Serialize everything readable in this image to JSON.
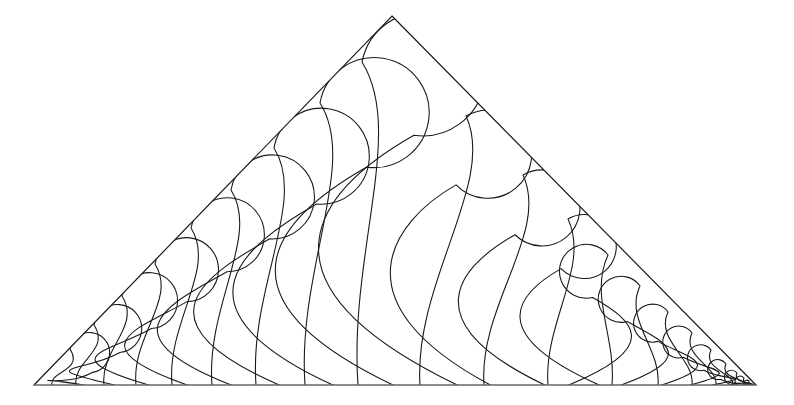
{
  "figure": {
    "title": "Nested teardrop tiling inside an isosceles triangle",
    "background_color": "#ffffff",
    "stroke_color": "#1a1a1a",
    "baseline_color": "#8c8c8c",
    "stroke_width": 1.1,
    "canvas": {
      "width": 794,
      "height": 405
    }
  },
  "triangle": {
    "name": "outer-triangle",
    "apex": {
      "x": 392,
      "y": 16
    },
    "bottom_left": {
      "x": 34,
      "y": 385
    },
    "bottom_right": {
      "x": 756,
      "y": 385
    },
    "base_width": 722,
    "height": 369,
    "left_slope_label": "left-slope",
    "right_slope_label": "right-slope",
    "base_label": "baseline"
  },
  "chart_data": {
    "type": "diagram",
    "title": "Nested teardrop tiling inside an isosceles triangle",
    "left_fan_count": 12,
    "right_fan_count": 9,
    "total_teardrops": 21,
    "left_fan": [
      {
        "index": 1,
        "base_x": 52,
        "bulb_cx": 89,
        "bulb_cy": 352,
        "bulb_r": 20,
        "tangent_x": 70,
        "tangent_y": 349
      },
      {
        "index": 2,
        "base_x": 76,
        "bulb_cx": 116,
        "bulb_cy": 328,
        "bulb_r": 24,
        "tangent_x": 94,
        "tangent_y": 325
      },
      {
        "index": 3,
        "base_x": 104,
        "bulb_cx": 147,
        "bulb_cy": 300,
        "bulb_r": 28,
        "tangent_x": 122,
        "tangent_y": 296
      },
      {
        "index": 4,
        "base_x": 136,
        "bulb_cx": 182,
        "bulb_cy": 269,
        "bulb_r": 32,
        "tangent_x": 155,
        "tangent_y": 264
      },
      {
        "index": 5,
        "base_x": 172,
        "bulb_cx": 221,
        "bulb_cy": 234,
        "bulb_r": 37,
        "tangent_x": 191,
        "tangent_y": 228
      },
      {
        "index": 6,
        "base_x": 212,
        "bulb_cx": 263,
        "bulb_cy": 196,
        "bulb_r": 42,
        "tangent_x": 231,
        "tangent_y": 190
      },
      {
        "index": 7,
        "base_x": 256,
        "bulb_cx": 309,
        "bulb_cy": 155,
        "bulb_r": 48,
        "tangent_x": 274,
        "tangent_y": 148
      },
      {
        "index": 8,
        "base_x": 305,
        "bulb_cx": 358,
        "bulb_cy": 111,
        "bulb_r": 55,
        "tangent_x": 320,
        "tangent_y": 103
      },
      {
        "index": 9,
        "base_x": 358,
        "bulb_cx": 404,
        "bulb_cy": 72,
        "bulb_r": 62,
        "tangent_x": 362,
        "tangent_y": 62
      },
      {
        "index": 10,
        "base_x": 420,
        "bulb_cx": 449,
        "bulb_cy": 140,
        "bulb_r": 44,
        "tangent_x": 466,
        "tangent_y": 116
      },
      {
        "index": 11,
        "base_x": 484,
        "bulb_cx": 509,
        "bulb_cy": 196,
        "bulb_r": 38,
        "tangent_x": 523,
        "tangent_y": 175
      },
      {
        "index": 12,
        "base_x": 548,
        "bulb_cx": 556,
        "bulb_cy": 236,
        "bulb_r": 32,
        "tangent_x": 568,
        "tangent_y": 219
      }
    ],
    "right_fan": [
      {
        "index": 1,
        "base_x": 612,
        "bulb_cx": 597,
        "bulb_cy": 270,
        "bulb_r": 27,
        "tangent_x": 608,
        "tangent_y": 255
      },
      {
        "index": 2,
        "base_x": 658,
        "bulb_cx": 631,
        "bulb_cy": 298,
        "bulb_r": 23,
        "tangent_x": 640,
        "tangent_y": 286
      },
      {
        "index": 3,
        "base_x": 692,
        "bulb_cx": 661,
        "bulb_cy": 322,
        "bulb_r": 19,
        "tangent_x": 668,
        "tangent_y": 312
      },
      {
        "index": 4,
        "base_x": 716,
        "bulb_cx": 686,
        "bulb_cy": 341,
        "bulb_r": 16,
        "tangent_x": 692,
        "tangent_y": 333
      },
      {
        "index": 5,
        "base_x": 733,
        "bulb_cx": 706,
        "bulb_cy": 357,
        "bulb_r": 13,
        "tangent_x": 711,
        "tangent_y": 350
      },
      {
        "index": 6,
        "base_x": 745,
        "bulb_cx": 722,
        "bulb_cy": 369,
        "bulb_r": 10,
        "tangent_x": 726,
        "tangent_y": 364
      },
      {
        "index": 7,
        "base_x": 752,
        "bulb_cx": 734,
        "bulb_cy": 377,
        "bulb_r": 7,
        "tangent_x": 737,
        "tangent_y": 373
      },
      {
        "index": 8,
        "base_x": 756,
        "bulb_cx": 742,
        "bulb_cy": 381,
        "bulb_r": 5,
        "tangent_x": 744,
        "tangent_y": 378
      },
      {
        "index": 9,
        "base_x": 758,
        "bulb_cx": 748,
        "bulb_cy": 383,
        "bulb_r": 3,
        "tangent_x": 749,
        "tangent_y": 381
      }
    ]
  }
}
